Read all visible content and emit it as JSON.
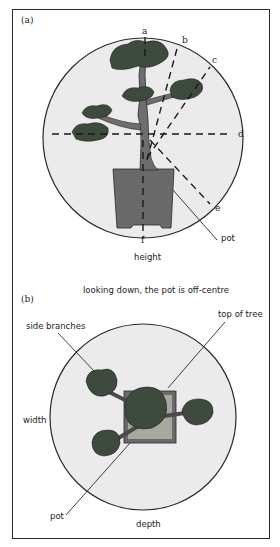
{
  "figure": {
    "panel_a": {
      "label": "(a)",
      "direction_labels": [
        "a",
        "b",
        "c",
        "d",
        "e",
        "f"
      ],
      "pot_label": "pot",
      "caption": "height"
    },
    "panel_b": {
      "label": "(b)",
      "heading": "looking down, the pot is off-centre",
      "side_branches_label": "side branches",
      "top_of_tree_label": "top of tree",
      "width_label": "width",
      "pot_label": "pot",
      "caption": "depth"
    },
    "colors": {
      "circle_fill": "#ebebeb",
      "outline": "#2a2a2a",
      "foliage": "#3f4a3f",
      "trunk": "#6e6e6e",
      "pot": "#6a6a6a",
      "soil": "#a8a8a0"
    }
  }
}
